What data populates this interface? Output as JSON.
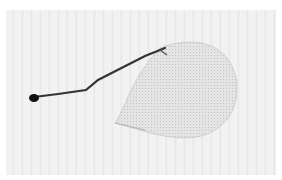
{
  "image": {
    "subject": "translucent insect wing with dark vein",
    "background_color": "#f2f2f2",
    "vein_color": "#222222",
    "membrane_color": "#d8d8d8"
  }
}
